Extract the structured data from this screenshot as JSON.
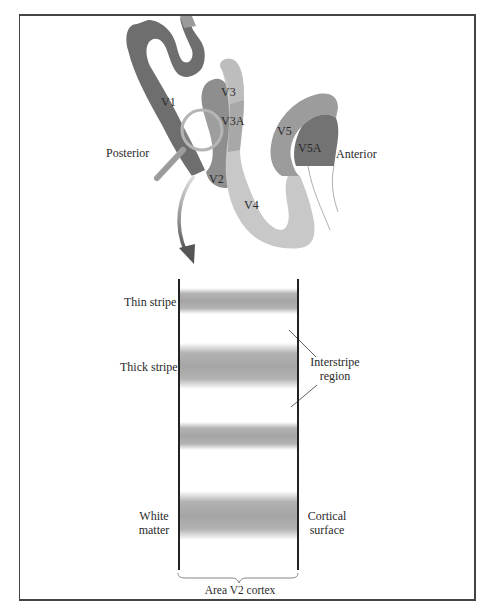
{
  "figure": {
    "brain_areas": [
      {
        "label": "V1",
        "color": "#6e6e6e"
      },
      {
        "label": "V2",
        "color": "#8e8e8e"
      },
      {
        "label": "V3",
        "color": "#bdbdbd"
      },
      {
        "label": "V3A",
        "color": "#a8a8a8"
      },
      {
        "label": "V4",
        "color": "#c8c8c8"
      },
      {
        "label": "V5",
        "color": "#9c9c9c"
      },
      {
        "label": "V5A",
        "color": "#737373"
      }
    ],
    "orientation": {
      "posterior": "Posterior",
      "anterior": "Anterior"
    },
    "cortex_section": {
      "stripes": [
        {
          "label": "Thin stripe",
          "type": "thin"
        },
        {
          "label": "Thick stripe",
          "type": "thick"
        },
        {
          "label": "",
          "type": "thin"
        },
        {
          "label": "",
          "type": "thick"
        }
      ],
      "interstripe_label_line1": "Interstripe",
      "interstripe_label_line2": "region",
      "left_label_line1": "White",
      "left_label_line2": "matter",
      "right_label_line1": "Cortical",
      "right_label_line2": "surface",
      "caption": "Area V2 cortex"
    }
  }
}
